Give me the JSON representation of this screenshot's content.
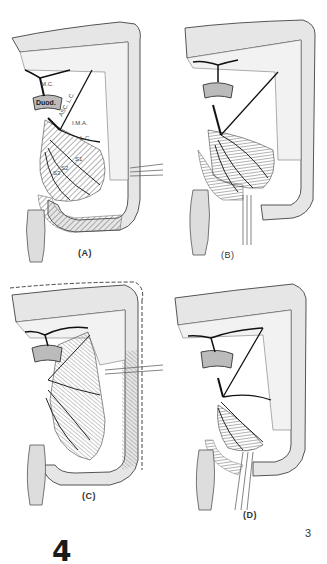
{
  "figure": {
    "number": "4",
    "page_number": "3",
    "panels": [
      {
        "id": "A",
        "caption": "(A)",
        "labels": {
          "middle_colic": "M.C.",
          "duodenum": "Duod.",
          "ascending_left_colic": "ASC. L.C.",
          "inferior_mesenteric_artery": "I.M.A.",
          "left_colic": "L.C.",
          "sigmoid_1": "S1",
          "sigmoid_2": "S2",
          "sigmoid_3": "S3"
        }
      },
      {
        "id": "B",
        "caption": "(B)"
      },
      {
        "id": "C",
        "caption": "(C)"
      },
      {
        "id": "D",
        "caption": "(D)"
      }
    ]
  },
  "colors": {
    "bowel_fill": "#e6e6e6",
    "outline": "#555555",
    "vessel": "#1a1a1a",
    "hatch": "#666666"
  }
}
